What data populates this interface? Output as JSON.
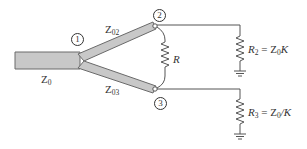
{
  "diagram": {
    "type": "Wilkinson power divider (unequal split)",
    "colors": {
      "line_fill": "#c8c8c8",
      "line_stroke": "#6a6a6a",
      "wire": "#555555"
    },
    "ports": [
      {
        "id": "1",
        "label": "1"
      },
      {
        "id": "2",
        "label": "2"
      },
      {
        "id": "3",
        "label": "3"
      }
    ],
    "lines": {
      "input": {
        "name": "Z",
        "sub": "0"
      },
      "branch_upper": {
        "name": "Z",
        "sub": "02"
      },
      "branch_lower": {
        "name": "Z",
        "sub": "03"
      }
    },
    "resistors": {
      "isolation": {
        "name": "R"
      },
      "load2": {
        "name": "R",
        "sub": "2",
        "eq": " = Z",
        "eq_sub": "0",
        "tail": "K"
      },
      "load3": {
        "name": "R",
        "sub": "3",
        "eq": " = Z",
        "eq_sub": "0",
        "tail": "/K"
      }
    }
  }
}
